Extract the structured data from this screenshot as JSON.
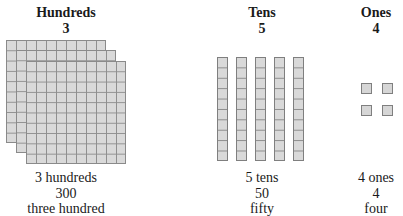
{
  "columns": [
    {
      "id": "hundreds",
      "title": "Hundreds",
      "digit": "3",
      "caption_count": "3 hundreds",
      "caption_number": "300",
      "caption_words": "three hundred",
      "block_type": "flat",
      "block_count": 3
    },
    {
      "id": "tens",
      "title": "Tens",
      "digit": "5",
      "caption_count": "5 tens",
      "caption_number": "50",
      "caption_words": "fifty",
      "block_type": "rod",
      "block_count": 5
    },
    {
      "id": "ones",
      "title": "Ones",
      "digit": "4",
      "caption_count": "4 ones",
      "caption_number": "4",
      "caption_words": "four",
      "block_type": "unit",
      "block_count": 4
    }
  ],
  "colors": {
    "block_fill": "#d9d9d9",
    "block_border": "#8a8a8a",
    "text": "#1a1a1a"
  }
}
